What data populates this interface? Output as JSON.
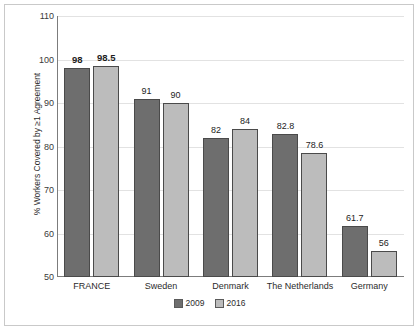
{
  "chart_data": {
    "type": "bar",
    "title": "",
    "subtitle": "",
    "xlabel": "",
    "ylabel": "% Workers Covered by ≥1 Agreement",
    "ylim": [
      50,
      110
    ],
    "yticks": [
      50,
      60,
      70,
      80,
      90,
      100,
      110
    ],
    "ytick_labels": [
      "50",
      "60",
      "70",
      "80",
      "90",
      "100",
      "110"
    ],
    "grid": true,
    "grid_axis": "y",
    "legend_position": "bottom-center",
    "categories": [
      "FRANCE",
      "Sweden",
      "Denmark",
      "The Netherlands",
      "Germany"
    ],
    "series": [
      {
        "name": "2009",
        "color": "#6e6e6e",
        "values": [
          98,
          91,
          82,
          82.8,
          61.7
        ],
        "labels": [
          "98",
          "91",
          "82",
          "82.8",
          "61.7"
        ]
      },
      {
        "name": "2016",
        "color": "#bcbcbc",
        "values": [
          98.5,
          90,
          84,
          78.6,
          56
        ],
        "labels": [
          "98.5",
          "90",
          "84",
          "78.6",
          "56"
        ]
      }
    ],
    "emphasized_category": "FRANCE",
    "emphasized_labels": [
      "98",
      "98.5"
    ]
  },
  "legend": {
    "items": [
      {
        "label": "2009",
        "color": "#6e6e6e"
      },
      {
        "label": "2016",
        "color": "#bcbcbc"
      }
    ]
  }
}
